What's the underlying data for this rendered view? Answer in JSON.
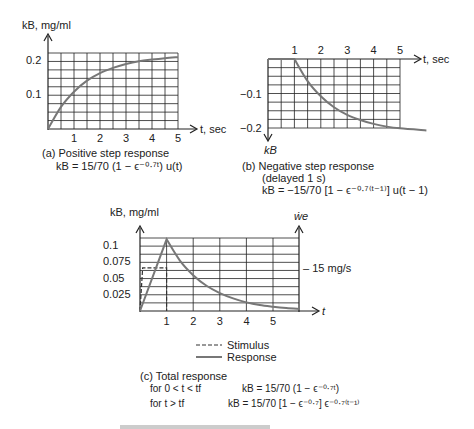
{
  "chart_data": [
    {
      "id": "a",
      "type": "line",
      "ylabel": "kB, mg/ml",
      "xlabel": "t, sec",
      "x_ticks": [
        "1",
        "2",
        "3",
        "4",
        "5"
      ],
      "y_ticks": [
        "0.1",
        "0.2"
      ],
      "xlim": [
        0,
        5
      ],
      "ylim": [
        0,
        0.22
      ],
      "grid": true,
      "series": [
        {
          "name": "Positive step response",
          "x": [
            0,
            0.5,
            1,
            1.5,
            2,
            2.5,
            3,
            3.5,
            4,
            4.5,
            5
          ],
          "values": [
            0,
            0.064,
            0.108,
            0.14,
            0.162,
            0.177,
            0.188,
            0.196,
            0.201,
            0.205,
            0.208
          ]
        }
      ],
      "caption": "(a) Positive step response",
      "equation": "kB = 15/70 (1 − ϵ^(−0.7t)) u(t)"
    },
    {
      "id": "b",
      "type": "line",
      "ylabel": "kB",
      "xlabel": "t, sec",
      "x_ticks": [
        "1",
        "2",
        "3",
        "4",
        "5"
      ],
      "y_ticks": [
        "−0.1",
        "−0.2"
      ],
      "xlim": [
        0,
        5
      ],
      "ylim": [
        -0.2,
        0
      ],
      "grid": true,
      "series": [
        {
          "name": "Negative step response",
          "x": [
            0,
            1,
            1.5,
            2,
            2.5,
            3,
            3.5,
            4,
            4.5,
            5,
            6
          ],
          "values": [
            0,
            0,
            -0.064,
            -0.108,
            -0.14,
            -0.162,
            -0.177,
            -0.188,
            -0.196,
            -0.201,
            -0.207
          ]
        }
      ],
      "caption": "(b) Negative step response",
      "caption2": "(delayed 1 s)",
      "equation": "kB = −15/70 [1 − ϵ^(−0.7(t − 1))] u(t − 1)"
    },
    {
      "id": "c",
      "type": "line",
      "ylabel": "kB, mg/ml",
      "ylabel_right": "ẇe",
      "xlabel": "t",
      "x_ticks": [
        "1",
        "2",
        "3",
        "4",
        "5"
      ],
      "y_ticks": [
        "0.025",
        "0.05",
        "0.075",
        "0.1"
      ],
      "xlim": [
        0,
        6
      ],
      "ylim": [
        0,
        0.11
      ],
      "grid": true,
      "right_annotation": "– 15 mg/s",
      "series": [
        {
          "name": "Response",
          "x": [
            0,
            1,
            1.5,
            2,
            2.5,
            3,
            3.5,
            4,
            4.5,
            5,
            5.5,
            6
          ],
          "values": [
            0,
            0.108,
            0.076,
            0.054,
            0.038,
            0.027,
            0.019,
            0.013,
            0.009,
            0.0065,
            0.0045,
            0.003
          ]
        },
        {
          "name": "Stimulus",
          "x": [
            0,
            0.1,
            1,
            1
          ],
          "values": [
            0,
            0.065,
            0.065,
            0
          ]
        }
      ],
      "legend": [
        {
          "label": "Stimulus",
          "style": "dashed"
        },
        {
          "label": "Response",
          "style": "solid"
        }
      ],
      "caption": "(c) Total response",
      "eq1_cond": "for 0 < t < tf",
      "eq1": "kB = 15/70 (1 − ϵ^(−0.7t))",
      "eq2_cond": "for t > tf",
      "eq2": "kB = 15/70 [1 − ϵ^(−0.7)] ϵ^(−0.7(t − 1))"
    }
  ],
  "labels": {
    "a_ylabel": "kB, mg/ml",
    "a_xlabel": "t, sec",
    "a_caption": "(a)  Positive step response",
    "a_eq": "kB = 15/70 (1 − ϵ⁻⁰·⁷ᵗ) u(t)",
    "b_xlabel": "t, sec",
    "b_ylabel": "kB",
    "b_caption": "(b)  Negative step response",
    "b_caption2": "(delayed 1 s)",
    "b_eq": "kB = −15/70 [1 − ϵ⁻⁰·⁷⁽ᵗ⁻¹⁾] u(t − 1)",
    "c_ylabel": "kB, mg/ml",
    "c_ylabel_right": "ẇe",
    "c_xlabel": "t",
    "c_annotation": "– 15 mg/s",
    "legend_stimulus": "Stimulus",
    "legend_response": "Response",
    "c_caption": "(c) Total response",
    "c_eq1_cond": "for 0 < t < tf",
    "c_eq1": "kB = 15/70 (1 − ϵ⁻⁰·⁷ᵗ)",
    "c_eq2_cond": "for t > tf",
    "c_eq2": "kB = 15/70 [1 − ϵ⁻⁰·⁷] ϵ⁻⁰·⁷⁽ᵗ⁻¹⁾"
  }
}
